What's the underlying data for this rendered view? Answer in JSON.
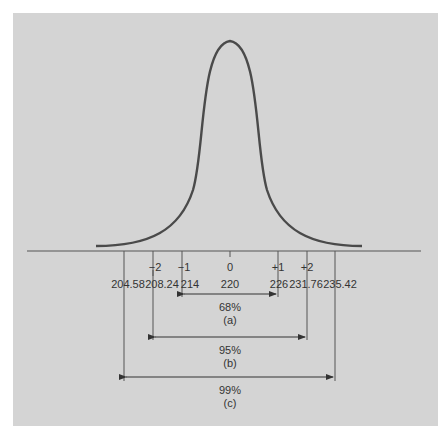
{
  "diagram": {
    "type": "normal-distribution-confidence-intervals",
    "mean": 220,
    "sigma_labels": [
      "−2",
      "−1",
      "0",
      "+1",
      "+2"
    ],
    "value_labels": [
      "204.58",
      "208.24",
      "214",
      "220",
      "226",
      "231.76",
      "235.42"
    ],
    "intervals": [
      {
        "percent": "68%",
        "tag": "(a)",
        "from": "214",
        "to": "226"
      },
      {
        "percent": "95%",
        "tag": "(b)",
        "from": "208.24",
        "to": "231.76"
      },
      {
        "percent": "99%",
        "tag": "(c)",
        "from": "204.58",
        "to": "235.42"
      }
    ],
    "colors": {
      "panel": "#d4d4d4",
      "curve": "#4a4a4a",
      "lines": "#555555"
    }
  }
}
